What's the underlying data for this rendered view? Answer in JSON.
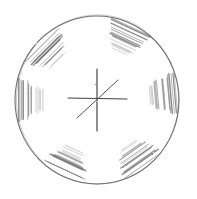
{
  "canvas": {
    "width": 197,
    "height": 199,
    "background": "#ffffff"
  },
  "drawing": {
    "style": "pencil sketch",
    "stroke_color": "#4a4a4a",
    "hatch_color": "#6e6e6e",
    "outer_circle": {
      "cx": 97,
      "cy": 100,
      "rx": 82,
      "ry": 84
    },
    "center_cross": {
      "vertical": {
        "x1": 97,
        "y1": 69,
        "x2": 97,
        "y2": 131
      },
      "horizontal": {
        "x1": 68,
        "y1": 98,
        "x2": 127,
        "y2": 99
      },
      "diagonal": {
        "x1": 77,
        "y1": 118,
        "x2": 118,
        "y2": 80
      }
    },
    "hatched_regions": [
      {
        "name": "top",
        "angle": -65
      },
      {
        "name": "upper-left",
        "angle": -135
      },
      {
        "name": "right",
        "angle": -5
      },
      {
        "name": "left",
        "angle": 180
      },
      {
        "name": "lower-right",
        "angle": 55
      },
      {
        "name": "bottom",
        "angle": 115
      }
    ]
  }
}
